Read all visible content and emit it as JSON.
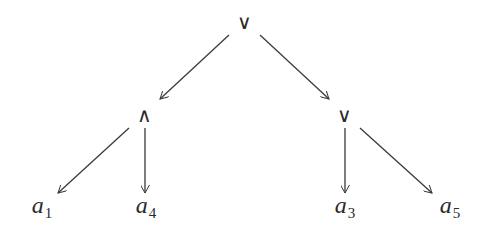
{
  "diagram": {
    "type": "tree",
    "nodes": {
      "root": {
        "label": "∨",
        "x": 244,
        "y": 22
      },
      "and": {
        "label": "∧",
        "x": 144,
        "y": 115
      },
      "or": {
        "label": "∨",
        "x": 344,
        "y": 115
      },
      "a1": {
        "base": "a",
        "sub": "1",
        "x": 42,
        "y": 207
      },
      "a4": {
        "base": "a",
        "sub": "4",
        "x": 146,
        "y": 207
      },
      "a3": {
        "base": "a",
        "sub": "3",
        "x": 345,
        "y": 207
      },
      "a5": {
        "base": "a",
        "sub": "5",
        "x": 450,
        "y": 207
      }
    },
    "edges": [
      {
        "from": "root",
        "to": "and",
        "x1": 229,
        "y1": 35,
        "x2": 160,
        "y2": 99
      },
      {
        "from": "root",
        "to": "or",
        "x1": 260,
        "y1": 35,
        "x2": 329,
        "y2": 99
      },
      {
        "from": "and",
        "to": "a1",
        "x1": 129,
        "y1": 128,
        "x2": 58,
        "y2": 193
      },
      {
        "from": "and",
        "to": "a4",
        "x1": 145,
        "y1": 128,
        "x2": 145,
        "y2": 193
      },
      {
        "from": "or",
        "to": "a3",
        "x1": 345,
        "y1": 128,
        "x2": 345,
        "y2": 193
      },
      {
        "from": "or",
        "to": "a5",
        "x1": 360,
        "y1": 128,
        "x2": 432,
        "y2": 193
      }
    ],
    "colors": {
      "stroke": "#3a3a3a",
      "text": "#2a2a2a",
      "background": "#ffffff"
    }
  }
}
